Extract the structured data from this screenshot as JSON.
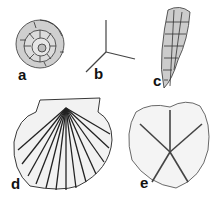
{
  "figure": {
    "panels": [
      {
        "id": "a",
        "label": "a",
        "subject": "foraminifera-spiral-test"
      },
      {
        "id": "b",
        "label": "b",
        "subject": "sponge-spicule-triaxon"
      },
      {
        "id": "c",
        "label": "c",
        "subject": "conical-shell"
      },
      {
        "id": "d",
        "label": "d",
        "subject": "scallop-shell"
      },
      {
        "id": "e",
        "label": "e",
        "subject": "echinoid-sand-dollar"
      }
    ],
    "colors": {
      "ink": "#1a1a1a",
      "background": "#ffffff"
    }
  }
}
